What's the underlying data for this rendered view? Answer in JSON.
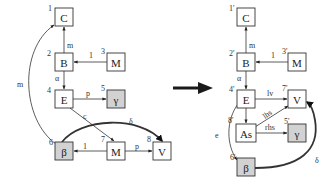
{
  "diagram": {
    "transform_arrow": {
      "from": "left_graph",
      "to": "right_graph",
      "color": "#1a1a1a"
    },
    "colors": {
      "node_fill": "#ffffff",
      "shaded_fill": "#d2d2d2",
      "stroke": "#333333"
    },
    "left_graph": {
      "nodes": [
        {
          "id": "C",
          "label": "C",
          "index": "1",
          "shaded": false
        },
        {
          "id": "B",
          "label": "B",
          "index": "2",
          "shaded": false
        },
        {
          "id": "M1",
          "label": "M",
          "index": "3",
          "shaded": false
        },
        {
          "id": "E",
          "label": "E",
          "index": "4",
          "shaded": false
        },
        {
          "id": "G",
          "label": "γ",
          "index": "5",
          "shaded": true
        },
        {
          "id": "Bt",
          "label": "β",
          "index": "6",
          "shaded": true
        },
        {
          "id": "M2",
          "label": "M",
          "index": "7",
          "shaded": false
        },
        {
          "id": "V",
          "label": "V",
          "index": "8",
          "shaded": false
        }
      ],
      "edges": [
        {
          "from": "B",
          "to": "C",
          "label": "m"
        },
        {
          "from": "M1",
          "to": "B",
          "label": "1"
        },
        {
          "from": "B",
          "to": "E",
          "label": "α"
        },
        {
          "from": "E",
          "to": "G",
          "label": "p"
        },
        {
          "from": "E",
          "to": "M2",
          "label": "c"
        },
        {
          "from": "Bt",
          "to": "V",
          "label": "δ",
          "bold": true
        },
        {
          "from": "M2",
          "to": "Bt",
          "label": "1"
        },
        {
          "from": "M2",
          "to": "V",
          "label": "p"
        },
        {
          "from": "Bt",
          "to": "C",
          "label": "m"
        }
      ]
    },
    "right_graph": {
      "nodes": [
        {
          "id": "C",
          "label": "C",
          "index": "1'",
          "shaded": false
        },
        {
          "id": "B",
          "label": "B",
          "index": "2'",
          "shaded": false
        },
        {
          "id": "M",
          "label": "M",
          "index": "3'",
          "shaded": false
        },
        {
          "id": "E",
          "label": "E",
          "index": "4'",
          "shaded": false
        },
        {
          "id": "V",
          "label": "V",
          "index": "7'",
          "shaded": false
        },
        {
          "id": "As",
          "label": "As",
          "index": "8'",
          "shaded": false
        },
        {
          "id": "G",
          "label": "γ",
          "index": "5'",
          "shaded": true
        },
        {
          "id": "Bt",
          "label": "β",
          "index": "6'",
          "shaded": true
        }
      ],
      "edges": [
        {
          "from": "B",
          "to": "C",
          "label": "m"
        },
        {
          "from": "M",
          "to": "B",
          "label": "1"
        },
        {
          "from": "B",
          "to": "E",
          "label": "α"
        },
        {
          "from": "E",
          "to": "V",
          "label": "lv"
        },
        {
          "from": "E",
          "to": "As",
          "label": ""
        },
        {
          "from": "As",
          "to": "V",
          "label": "lhs"
        },
        {
          "from": "As",
          "to": "G",
          "label": "rhs"
        },
        {
          "from": "E",
          "to": "Bt",
          "label": "e"
        },
        {
          "from": "Bt",
          "to": "V",
          "label": "δ",
          "bold": true
        }
      ]
    }
  }
}
